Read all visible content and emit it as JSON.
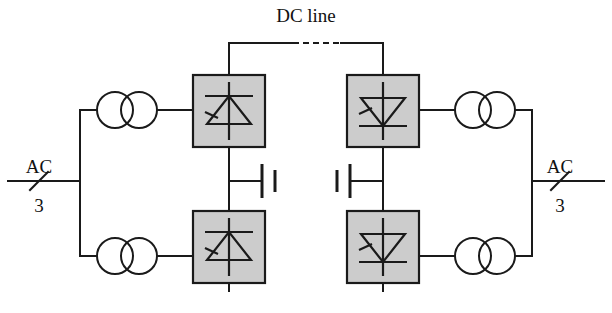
{
  "figure": {
    "kind": "schematic-diagram",
    "background_color": "#ffffff",
    "line_color": "#1a1a1a",
    "converter_fill_color": "#cccccc"
  },
  "labels": {
    "dc_line": "DC line",
    "ac_left": "AC",
    "ac_right": "AC",
    "phases_left": "3",
    "phases_right": "3"
  },
  "left_station": {
    "name": "rectifier-station",
    "ac_source_label": "AC",
    "phase_count": "3",
    "transformers": [
      {
        "id": "upper",
        "name": "transformer-left-upper",
        "symbol": "two-overlapping-circles"
      },
      {
        "id": "lower",
        "name": "transformer-left-lower",
        "symbol": "two-overlapping-circles"
      }
    ],
    "converters": [
      {
        "id": "upper",
        "name": "converter-left-upper",
        "symbol": "thyristor-up",
        "fill": "#cccccc"
      },
      {
        "id": "lower",
        "name": "converter-left-lower",
        "symbol": "thyristor-up",
        "fill": "#cccccc"
      }
    ],
    "capacitor": {
      "name": "capacitor-left",
      "symbol": "capacitor-plates"
    }
  },
  "right_station": {
    "name": "inverter-station",
    "ac_source_label": "AC",
    "phase_count": "3",
    "transformers": [
      {
        "id": "upper",
        "name": "transformer-right-upper",
        "symbol": "two-overlapping-circles"
      },
      {
        "id": "lower",
        "name": "transformer-right-lower",
        "symbol": "two-overlapping-circles"
      }
    ],
    "converters": [
      {
        "id": "upper",
        "name": "converter-right-upper",
        "symbol": "thyristor-down",
        "fill": "#cccccc"
      },
      {
        "id": "lower",
        "name": "converter-right-lower",
        "symbol": "thyristor-down",
        "fill": "#cccccc"
      }
    ],
    "capacitor": {
      "name": "capacitor-right",
      "symbol": "capacitor-plates"
    }
  },
  "dc_link": {
    "name": "dc-transmission-line",
    "label": "DC line",
    "style": "solid-with-dashed-middle-segment"
  }
}
